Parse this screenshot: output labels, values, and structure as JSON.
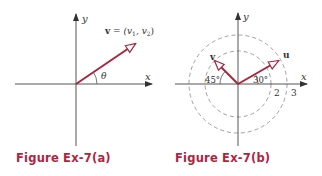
{
  "figures": [
    {
      "id": "a",
      "caption": "Figure Ex-7(a)",
      "axis_labels": {
        "x": "x",
        "y": "y"
      },
      "vector_label_bold": "v",
      "vector_label_rest": " = (v",
      "sub1": "1",
      "sep": ", v",
      "sub2": "2",
      "close": ")",
      "angle_label": "θ"
    },
    {
      "id": "b",
      "caption": "Figure Ex-7(b)",
      "axis_labels": {
        "x": "x",
        "y": "y"
      },
      "vectors": [
        {
          "name": "u",
          "length": 2,
          "angle_deg": 30,
          "angle_label": "30°"
        },
        {
          "name": "v",
          "length": 3,
          "angle_deg": 135,
          "angle_label": "45°"
        }
      ],
      "circle_labels": [
        "2",
        "3"
      ]
    }
  ],
  "colors": {
    "vector": "#a6263e",
    "axis": "#555555",
    "circle": "#888888",
    "caption": "#b0243f"
  }
}
